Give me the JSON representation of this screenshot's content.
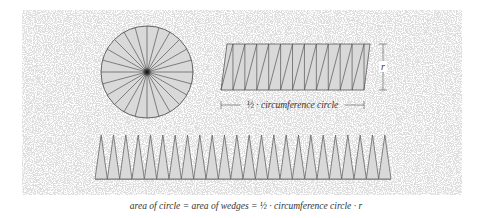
{
  "diagram": {
    "colors": {
      "background": "#ffffff",
      "speckle": "#d6d6d6",
      "wedge_fill": "#d9d9d9",
      "stroke": "#555555",
      "text": "#333333"
    },
    "circle": {
      "cx": 147,
      "cy": 72,
      "r": 46,
      "wedge_count": 24
    },
    "parallelogram": {
      "top_left_x": 227,
      "top_right_x": 370,
      "bottom_left_x": 221,
      "bottom_right_x": 364,
      "top_y": 44,
      "bottom_y": 90,
      "wedges_up": 12,
      "wedges_down": 12
    },
    "radius_marker": {
      "x": 383,
      "y1": 44,
      "y2": 90,
      "label": "r"
    },
    "half_circumference_marker": {
      "x1": 221,
      "x2": 364,
      "y": 105,
      "label": "½ · circumference circle"
    },
    "wedge_row": {
      "x_start": 95,
      "x_end": 391,
      "base_y": 179,
      "apex_y": 135,
      "wedge_count": 24
    },
    "caption": "area of circle = area of wedges = ½ · circumference circle · r"
  }
}
